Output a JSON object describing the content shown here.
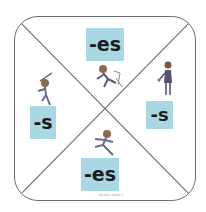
{
  "board": {
    "quadrants": [
      {
        "position": "top",
        "suffix": "-es",
        "figure": "person-tripping-over-chair"
      },
      {
        "position": "left",
        "suffix": "-s",
        "figure": "person-jumping"
      },
      {
        "position": "right",
        "suffix": "-s",
        "figure": "person-standing-with-wand"
      },
      {
        "position": "bottom",
        "suffix": "-es",
        "figure": "person-running"
      }
    ],
    "colors": {
      "tile": "#a9d7e3",
      "border": "#6e6e6e",
      "text": "#1c1c1c"
    },
    "caption": "Spinner sheet 3"
  }
}
